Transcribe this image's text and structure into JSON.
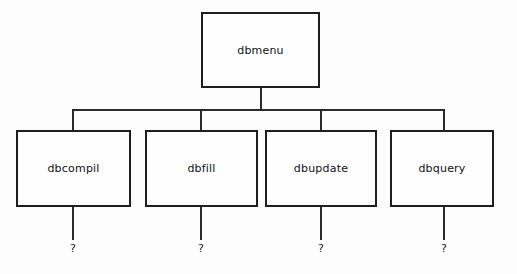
{
  "diagram": {
    "type": "hierarchy-tree",
    "colors": {
      "background": "#fdfdfd",
      "box_fill": "#fefefe",
      "box_stroke": "#1f1f1f",
      "edge_stroke": "#2a2a2a",
      "text": "#111111"
    },
    "root": {
      "label": "dbmenu",
      "x": 201,
      "y": 12,
      "width": 119,
      "height": 76
    },
    "bus": {
      "y": 109,
      "x_start": 73,
      "x_end": 444
    },
    "children": [
      {
        "label": "dbcompil",
        "x": 16,
        "y": 130,
        "width": 115,
        "height": 77,
        "connector_x": 73,
        "unknown_label": "?"
      },
      {
        "label": "dbfill",
        "x": 145,
        "y": 130,
        "width": 113,
        "height": 77,
        "connector_x": 201,
        "unknown_label": "?"
      },
      {
        "label": "dbupdate",
        "x": 265,
        "y": 130,
        "width": 112,
        "height": 77,
        "connector_x": 321,
        "unknown_label": "?"
      },
      {
        "label": "dbquery",
        "x": 390,
        "y": 130,
        "width": 104,
        "height": 77,
        "connector_x": 444,
        "unknown_label": "?"
      }
    ],
    "unknown_marks_y": 243,
    "leaf_stub_top": 207,
    "leaf_stub_bottom": 240
  }
}
